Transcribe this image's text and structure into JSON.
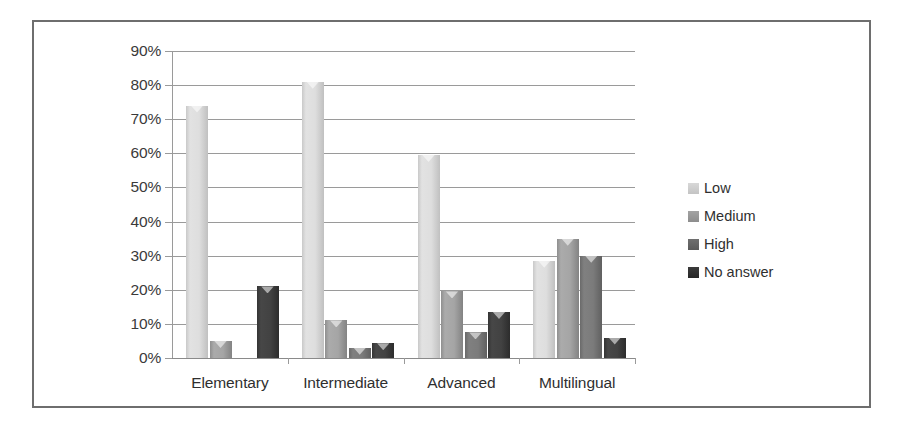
{
  "chart_data": {
    "type": "bar",
    "title": "",
    "xlabel": "",
    "ylabel": "",
    "ylim": [
      0,
      90
    ],
    "ytick_labels": [
      "0%",
      "10%",
      "20%",
      "30%",
      "40%",
      "50%",
      "60%",
      "70%",
      "80%",
      "90%"
    ],
    "ytick_values": [
      0,
      10,
      20,
      30,
      40,
      50,
      60,
      70,
      80,
      90
    ],
    "grid": true,
    "legend_position": "right",
    "categories": [
      "Elementary",
      "Intermediate",
      "Advanced",
      "Multilingual"
    ],
    "series": [
      {
        "name": "Low",
        "color": "#d8d8d8",
        "values": [
          74,
          81,
          59.5,
          28.5
        ]
      },
      {
        "name": "Medium",
        "color": "#a3a3a3",
        "values": [
          5,
          11,
          19.5,
          35
        ]
      },
      {
        "name": "High",
        "color": "#6f6f6f",
        "values": [
          0,
          3,
          7.5,
          30
        ]
      },
      {
        "name": "No answer",
        "color": "#333333",
        "values": [
          21,
          4.3,
          13.5,
          6
        ]
      }
    ]
  },
  "legend": {
    "items": [
      {
        "label": "Low"
      },
      {
        "label": "Medium"
      },
      {
        "label": "High"
      },
      {
        "label": "No answer"
      }
    ]
  }
}
